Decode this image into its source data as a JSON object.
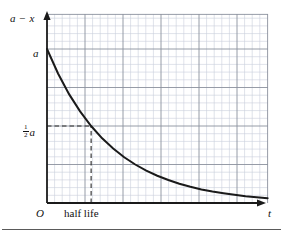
{
  "figure": {
    "caption_axis_y": "a − x",
    "caption_axis_x": "t",
    "origin_label": "O",
    "tick_a_label": "a",
    "half_amplitude_numerator": "1",
    "half_amplitude_denominator": "2",
    "half_amplitude_variable": "a",
    "half_life_label": "half life"
  },
  "chart_data": {
    "type": "line",
    "title": "",
    "subtitle": "",
    "xlabel": "t",
    "ylabel": "a − x",
    "xlim": [
      0,
      10
    ],
    "ylim": [
      0,
      1.15
    ],
    "grid": true,
    "grid_minor": true,
    "grid_major_every": 5,
    "legend": "none",
    "annotations": [
      {
        "text": "a",
        "x": 0,
        "y": 1.0,
        "role": "y-intercept-tick"
      },
      {
        "text": "1/2 a",
        "x": 0,
        "y": 0.5,
        "role": "y-half-tick"
      },
      {
        "text": "half life",
        "x": 2.0,
        "y": 0,
        "role": "x-axis-caption"
      },
      {
        "text": "O",
        "x": 0,
        "y": 0,
        "role": "origin"
      }
    ],
    "guides": [
      {
        "type": "dashed-horizontal",
        "y": 0.5,
        "from_x": 0,
        "to_x": 2.0
      },
      {
        "type": "dashed-vertical",
        "x": 2.0,
        "from_y": 0,
        "to_y": 0.5
      }
    ],
    "series": [
      {
        "name": "exponential decay of a − x",
        "equation": "(a − x) = a·e^(−kt), half life at t = 2",
        "x": [
          0.0,
          0.5,
          1.0,
          1.5,
          2.0,
          2.5,
          3.0,
          3.5,
          4.0,
          4.5,
          5.0,
          5.5,
          6.0,
          6.5,
          7.0,
          7.5,
          8.0,
          8.5,
          9.0,
          9.5,
          10.0
        ],
        "y": [
          1.0,
          0.841,
          0.707,
          0.595,
          0.5,
          0.42,
          0.354,
          0.297,
          0.25,
          0.21,
          0.177,
          0.149,
          0.125,
          0.105,
          0.088,
          0.074,
          0.063,
          0.053,
          0.044,
          0.037,
          0.031
        ]
      }
    ],
    "colors": {
      "curve": "#1a1a1a",
      "axis": "#1a1a1a",
      "grid_minor": "#c9cedb",
      "grid_major": "#8b919d",
      "guide_dash": "#2b2b2b",
      "rule": "#5a5a5a",
      "background": "#ffffff"
    }
  }
}
